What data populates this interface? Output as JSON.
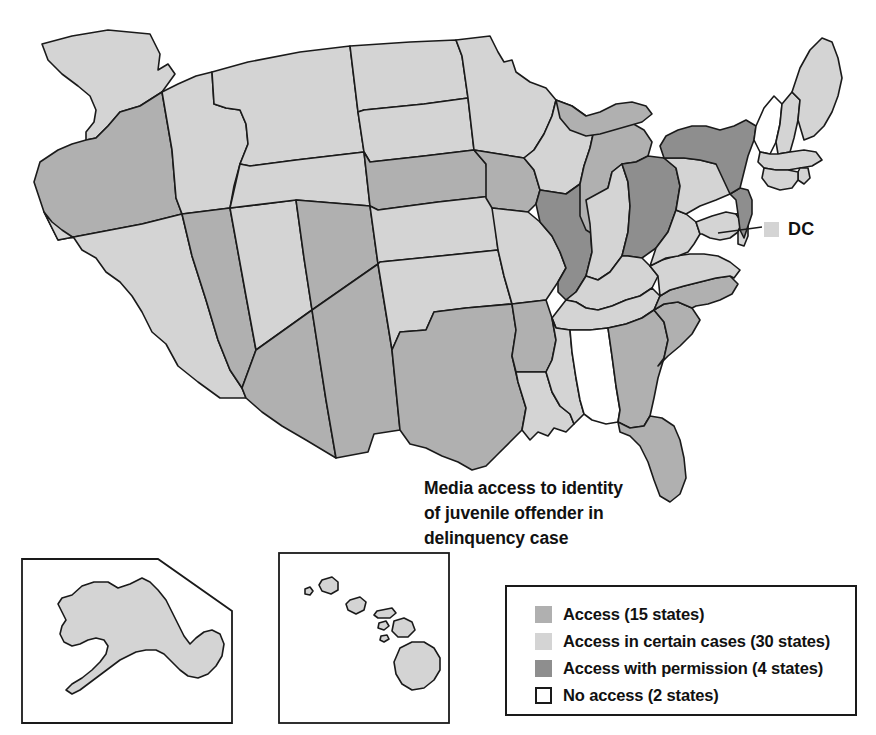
{
  "title": {
    "line1": "Media access to identity",
    "line2": "of juvenile offender in",
    "line3": "delinquency case"
  },
  "dc_callout": {
    "label": "DC",
    "category": "access-in-certain-cases",
    "color": "#cfcfcf"
  },
  "legend": {
    "items": [
      {
        "label": "Access (15 states)",
        "color": "#b0b0b0",
        "key": "access",
        "outlined": false
      },
      {
        "label": "Access in certain cases (30 states)",
        "color": "#d4d4d4",
        "key": "access-in-certain-cases",
        "outlined": false
      },
      {
        "label": "Access with permission (4 states)",
        "color": "#8e8e8e",
        "key": "access-with-permission",
        "outlined": false
      },
      {
        "label": "No access (2 states)",
        "color": "#ffffff",
        "key": "no-access",
        "outlined": true
      }
    ]
  },
  "map": {
    "colors": {
      "access": "#b0b0b0",
      "access-in-certain-cases": "#d4d4d4",
      "access-with-permission": "#8e8e8e",
      "no-access": "#ffffff",
      "border": "#1a1a1a"
    },
    "categories": {
      "AL": "no-access",
      "VT": "no-access",
      "IL": "access-with-permission",
      "OH": "access-with-permission",
      "NY": "access-with-permission",
      "NJ": "access-with-permission",
      "OR": "access",
      "NV": "access",
      "AZ": "access",
      "NM": "access",
      "TX": "access",
      "CO": "access",
      "NE": "access",
      "IA": "access",
      "AR": "access",
      "GA": "access",
      "SC": "access",
      "FL": "access",
      "MI": "access",
      "NC": "access",
      "WA": "access-in-certain-cases",
      "ID": "access-in-certain-cases",
      "MT": "access-in-certain-cases",
      "WY": "access-in-certain-cases",
      "UT": "access-in-certain-cases",
      "CA": "access-in-certain-cases",
      "ND": "access-in-certain-cases",
      "SD": "access-in-certain-cases",
      "KS": "access-in-certain-cases",
      "OK": "access-in-certain-cases",
      "MN": "access-in-certain-cases",
      "WI": "access-in-certain-cases",
      "MO": "access-in-certain-cases",
      "LA": "access-in-certain-cases",
      "MS": "access-in-certain-cases",
      "TN": "access-in-certain-cases",
      "KY": "access-in-certain-cases",
      "IN": "access-in-certain-cases",
      "WV": "access-in-certain-cases",
      "VA": "access-in-certain-cases",
      "MD": "access-in-certain-cases",
      "DE": "access-in-certain-cases",
      "PA": "access-in-certain-cases",
      "CT": "access-in-certain-cases",
      "RI": "access-in-certain-cases",
      "MA": "access-in-certain-cases",
      "NH": "access-in-certain-cases",
      "ME": "access-in-certain-cases",
      "AK": "access-in-certain-cases",
      "HI": "access-in-certain-cases"
    }
  },
  "chart_data": {
    "type": "map",
    "title": "Media access to identity of juvenile offender in delinquency case",
    "regions": "US states choropleth with Alaska and Hawaii insets and a DC callout",
    "categories": [
      {
        "name": "Access",
        "count": 15,
        "color": "#b0b0b0"
      },
      {
        "name": "Access in certain cases",
        "count": 30,
        "color": "#d4d4d4"
      },
      {
        "name": "Access with permission",
        "count": 4,
        "color": "#8e8e8e"
      },
      {
        "name": "No access",
        "count": 2,
        "color": "#ffffff"
      }
    ],
    "legend_position": "bottom-right"
  }
}
